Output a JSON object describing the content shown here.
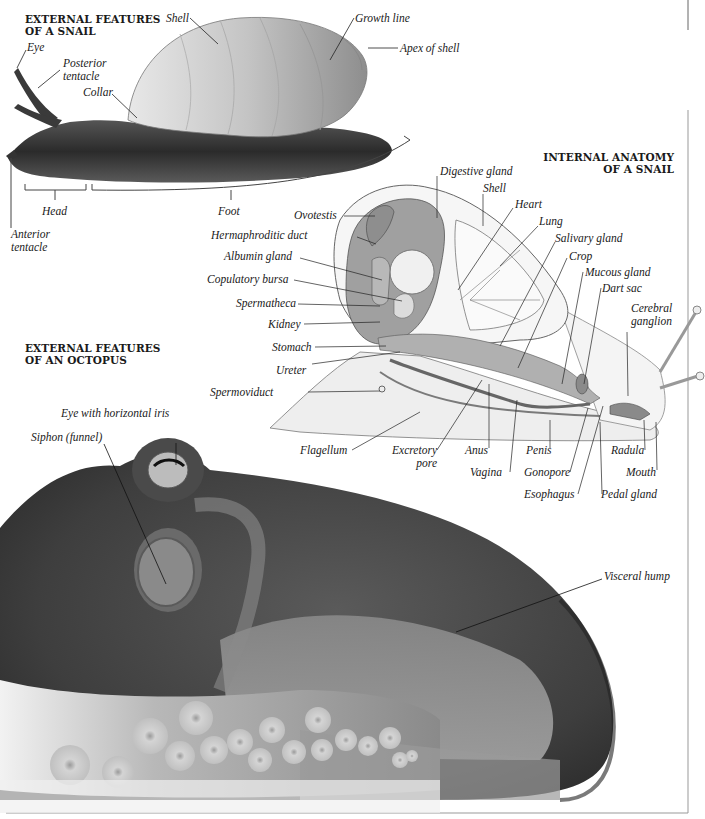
{
  "snail_external": {
    "title": "EXTERNAL FEATURES\nOF A SNAIL",
    "labels": {
      "eye": "Eye",
      "posterior_tentacle": "Posterior\ntentacle",
      "collar": "Collar",
      "shell": "Shell",
      "growth_line": "Growth line",
      "apex_of_shell": "Apex of shell",
      "head": "Head",
      "foot": "Foot",
      "anterior_tentacle": "Anterior\ntentacle"
    }
  },
  "snail_internal": {
    "title": "INTERNAL ANATOMY\nOF A SNAIL",
    "labels": {
      "digestive_gland": "Digestive gland",
      "shell": "Shell",
      "heart": "Heart",
      "lung": "Lung",
      "salivary_gland": "Salivary gland",
      "crop": "Crop",
      "mucous_gland": "Mucous gland",
      "dart_sac": "Dart sac",
      "cerebral_ganglion": "Cerebral\nganglion",
      "ovotestis": "Ovotestis",
      "hermaphroditic_duct": "Hermaphroditic duct",
      "albumin_gland": "Albumin gland",
      "copulatory_bursa": "Copulatory bursa",
      "spermatheca": "Spermatheca",
      "kidney": "Kidney",
      "stomach": "Stomach",
      "ureter": "Ureter",
      "spermoviduct": "Spermoviduct",
      "flagellum": "Flagellum",
      "excretory_pore": "Excretory\npore",
      "anus": "Anus",
      "vagina": "Vagina",
      "penis": "Penis",
      "gonopore": "Gonopore",
      "esophagus": "Esophagus",
      "radula": "Radula",
      "mouth": "Mouth",
      "pedal_gland": "Pedal gland"
    }
  },
  "octopus_external": {
    "title": "EXTERNAL FEATURES\nOF AN OCTOPUS",
    "labels": {
      "eye_with_horizontal_iris": "Eye with horizontal iris",
      "siphon": "Siphon (funnel)",
      "visceral_hump": "Visceral hump"
    }
  },
  "colors": {
    "ink": "#1a1a1a",
    "paper": "#ffffff",
    "octopus_dark": "#3a3a3a",
    "octopus_mid": "#6e6e6e",
    "octopus_light": "#a8a8a8",
    "snail_body": "#2a2a2a",
    "shell_light": "#cfcfcf",
    "diagram_fill": "#9a9a9a"
  }
}
